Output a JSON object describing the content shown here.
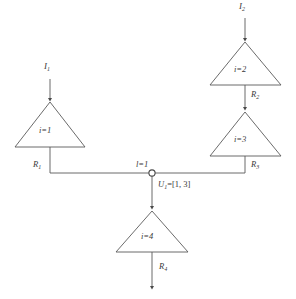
{
  "figure": {
    "type": "circuit-network-diagram",
    "background_color": "#ffffff",
    "line_color": "#5a5a5a",
    "text_color": "#3a3a3a"
  },
  "blocks": [
    {
      "id": "tri1",
      "label": "i=1",
      "label_prefix": "i",
      "label_value": "1"
    },
    {
      "id": "tri2",
      "label": "i=2",
      "label_prefix": "i",
      "label_value": "2"
    },
    {
      "id": "tri3",
      "label": "i=3",
      "label_prefix": "i",
      "label_value": "3"
    },
    {
      "id": "tri4",
      "label": "i=4",
      "label_prefix": "i",
      "label_value": "4"
    }
  ],
  "currents": [
    {
      "id": "I1",
      "base": "I",
      "subscript": "1"
    },
    {
      "id": "I2",
      "base": "I",
      "subscript": "2"
    }
  ],
  "resistors": [
    {
      "id": "R1",
      "base": "R",
      "subscript": "1"
    },
    {
      "id": "R2",
      "base": "R",
      "subscript": "2"
    },
    {
      "id": "R3",
      "base": "R",
      "subscript": "3"
    },
    {
      "id": "R4",
      "base": "R",
      "subscript": "4"
    }
  ],
  "node": {
    "index_label": "l=1",
    "voltage_base": "U",
    "voltage_subscript": "1",
    "voltage_assignment": "=[1, 3]",
    "voltage_full": "U1=[1, 3]",
    "marker": "hollow-circle-node"
  }
}
